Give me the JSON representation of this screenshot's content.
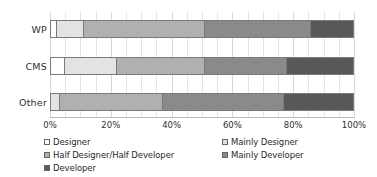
{
  "chart_data": {
    "type": "bar",
    "orientation": "horizontal",
    "stacked": true,
    "normalized": true,
    "title": "",
    "subtitle": "",
    "xlabel": "",
    "ylabel": "",
    "categories": [
      "WP",
      "CMS",
      "Other"
    ],
    "xlim": [
      0,
      100
    ],
    "xticks": [
      0,
      20,
      40,
      60,
      80,
      100
    ],
    "xticklabels": [
      "0%",
      "20%",
      "40%",
      "60%",
      "80%",
      "100%"
    ],
    "grid": true,
    "legend_position": "bottom",
    "legend_columns": 2,
    "series": [
      {
        "name": "Designer",
        "color": "#ffffff",
        "values": [
          2,
          4.5,
          0
        ]
      },
      {
        "name": "Mainly Designer",
        "color": "#e3e3e3",
        "values": [
          9,
          17.5,
          3
        ]
      },
      {
        "name": "Half Designer/Half Developer",
        "color": "#b0b0b0",
        "values": [
          40,
          29,
          34
        ]
      },
      {
        "name": "Mainly Developer",
        "color": "#8a8a8a",
        "values": [
          35,
          27,
          40
        ]
      },
      {
        "name": "Developer",
        "color": "#585858",
        "values": [
          14,
          22,
          23
        ]
      }
    ]
  },
  "axis": {
    "tick_labels": [
      "0%",
      "20%",
      "40%",
      "60%",
      "80%",
      "100%"
    ],
    "category_labels": [
      "WP",
      "CMS",
      "Other"
    ]
  },
  "legend": {
    "left_column": [
      "Designer",
      "Half Designer/Half Developer",
      "Developer"
    ],
    "right_column": [
      "Mainly Designer",
      "Mainly Developer"
    ]
  },
  "colors": {
    "designer": "#ffffff",
    "mainly_designer": "#e3e3e3",
    "half_half": "#b0b0b0",
    "mainly_developer": "#8a8a8a",
    "developer": "#585858",
    "outline": "#7a7a7a",
    "gridline": "#e3e3e3",
    "axis": "#b9b9b9",
    "text": "#2b2b2b",
    "background": "#ffffff"
  }
}
